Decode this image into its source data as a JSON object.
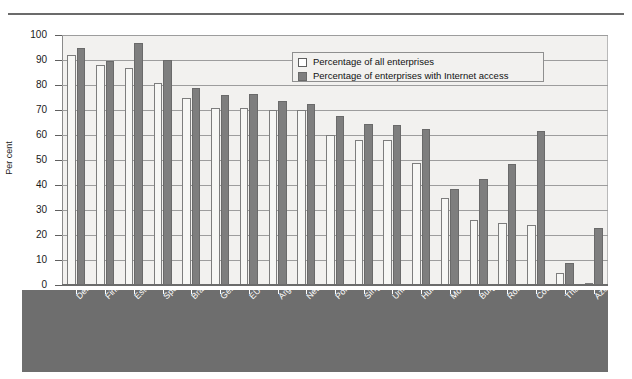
{
  "chart_data": {
    "type": "bar",
    "title": "",
    "xlabel": "",
    "ylabel": "Per cent",
    "ylim": [
      0,
      100
    ],
    "ytick_step": 10,
    "yticks": [
      0,
      10,
      20,
      30,
      40,
      50,
      60,
      70,
      80,
      90,
      100
    ],
    "grid": true,
    "legend_position": "top-right-inside",
    "categories": [
      "Denmark",
      "Finland",
      "Estonia",
      "Spain",
      "Brazil",
      "Germany",
      "EU average",
      "Argentina (1) (2)",
      "Netherlands",
      "Poland",
      "Singapore",
      "United Kingdom",
      "Hungary",
      "Morocco",
      "Bulgaria (2)",
      "Romania (2)",
      "Costa Rica (2) (3)",
      "Thailand (4)",
      "Azerbaijan (5)"
    ],
    "series": [
      {
        "name": "Percentage of all enterprises",
        "color": "#f7f7f5",
        "values": [
          92,
          88,
          87,
          81,
          75,
          71,
          71,
          70,
          70,
          60,
          58,
          58,
          49,
          35,
          26,
          25,
          24,
          5,
          1
        ]
      },
      {
        "name": "Percentage of enterprises with Internet access",
        "color": "#7e7e7e",
        "values": [
          95,
          89.5,
          97,
          90,
          79,
          76,
          76.5,
          73.5,
          72.5,
          67.5,
          64.5,
          64,
          62.5,
          38.5,
          42.5,
          48.5,
          61.5,
          9,
          23
        ]
      }
    ]
  },
  "legend": {
    "items": [
      {
        "label": "Percentage of all enterprises",
        "swatch": "light"
      },
      {
        "label": "Percentage of enterprises with Internet access",
        "swatch": "dark"
      }
    ]
  }
}
